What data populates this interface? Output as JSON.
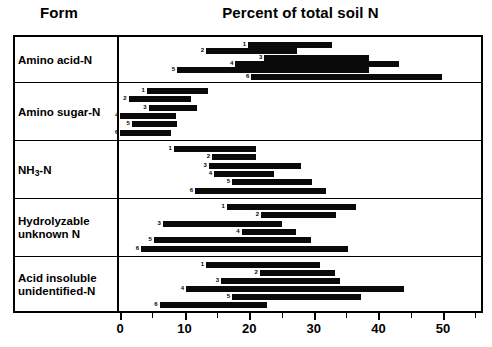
{
  "header": {
    "form_label": "Form",
    "chart_title": "Percent of total soil N"
  },
  "axis": {
    "label_0": "0",
    "label_10": "10",
    "label_20": "20",
    "label_30": "30",
    "label_40": "40",
    "label_50": "50"
  },
  "rows": [
    {
      "label": "Amino acid-N",
      "label_html": "Amino acid-N"
    },
    {
      "label": "Amino sugar-N",
      "label_html": "Amino sugar-N"
    },
    {
      "label": "NH3-N",
      "label_html": "NH<sub>3</sub>-N"
    },
    {
      "label": "Hydrolyzable unknown N",
      "label_html": "Hydrolyzable<br>unknown N"
    },
    {
      "label": "Acid insoluble unidentified-N",
      "label_html": "Acid insoluble<br>unidentified-N"
    }
  ],
  "chart_data": {
    "type": "bar",
    "orientation": "horizontal-range",
    "title": "Percent of total soil N",
    "xlabel": "Percent of total soil N",
    "ylabel": "Form",
    "xlim": [
      0,
      55
    ],
    "xticks": [
      0,
      10,
      20,
      30,
      40,
      50
    ],
    "xticks_minor_step": 5,
    "grid": false,
    "legend": "none",
    "bar_color": "#0a0a0a",
    "series_labels": [
      "1",
      "2",
      "3",
      "4",
      "5",
      "6"
    ],
    "note": "Each row shows six numbered range bars (study 1-6) spanning the min-max percent of total soil N.",
    "groups": [
      {
        "category": "Amino acid-N",
        "bars": [
          {
            "n": "1",
            "start": 20.0,
            "end": 33.0
          },
          {
            "n": "2",
            "start": 13.5,
            "end": 27.5
          },
          {
            "n": "3",
            "start": 22.5,
            "end": 38.7
          },
          {
            "n": "4",
            "start": 18.0,
            "end": 43.3
          },
          {
            "n": "5",
            "start": 9.0,
            "end": 38.7
          },
          {
            "n": "6",
            "start": 20.5,
            "end": 50.0
          }
        ]
      },
      {
        "category": "Amino sugar-N",
        "bars": [
          {
            "n": "1",
            "start": 4.3,
            "end": 13.8
          },
          {
            "n": "2",
            "start": 1.5,
            "end": 11.1
          },
          {
            "n": "3",
            "start": 4.6,
            "end": 12.1
          },
          {
            "n": "4",
            "start": 0.2,
            "end": 8.8
          },
          {
            "n": "5",
            "start": 2.0,
            "end": 9.0
          },
          {
            "n": "6",
            "start": 0.2,
            "end": 8.0
          }
        ]
      },
      {
        "category": "NH3-N",
        "bars": [
          {
            "n": "1",
            "start": 8.5,
            "end": 21.2
          },
          {
            "n": "2",
            "start": 14.4,
            "end": 21.2
          },
          {
            "n": "3",
            "start": 13.9,
            "end": 28.2
          },
          {
            "n": "4",
            "start": 14.7,
            "end": 24.0
          },
          {
            "n": "5",
            "start": 17.5,
            "end": 29.9
          },
          {
            "n": "6",
            "start": 11.8,
            "end": 32.0
          }
        ]
      },
      {
        "category": "Hydrolyzable unknown N",
        "bars": [
          {
            "n": "1",
            "start": 16.7,
            "end": 36.7
          },
          {
            "n": "2",
            "start": 22.0,
            "end": 33.6
          },
          {
            "n": "3",
            "start": 6.8,
            "end": 25.2
          },
          {
            "n": "4",
            "start": 19.0,
            "end": 27.4
          },
          {
            "n": "5",
            "start": 5.4,
            "end": 29.7
          },
          {
            "n": "6",
            "start": 3.4,
            "end": 35.4
          }
        ]
      },
      {
        "category": "Acid insoluble unidentified-N",
        "bars": [
          {
            "n": "1",
            "start": 13.5,
            "end": 31.1
          },
          {
            "n": "2",
            "start": 21.8,
            "end": 33.4
          },
          {
            "n": "3",
            "start": 15.8,
            "end": 34.2
          },
          {
            "n": "4",
            "start": 10.4,
            "end": 44.1
          },
          {
            "n": "5",
            "start": 17.5,
            "end": 37.5
          },
          {
            "n": "6",
            "start": 6.3,
            "end": 22.9
          }
        ]
      }
    ]
  }
}
